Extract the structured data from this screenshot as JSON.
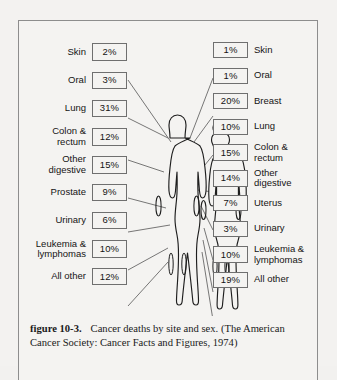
{
  "figure": {
    "caption_label": "figure 10-3.",
    "caption_text": "Cancer deaths by site and sex. (The American Cancer Society: Cancer Facts and Figures, 1974)"
  },
  "chart_data": {
    "type": "bar",
    "title": "Cancer deaths by site and sex",
    "source": "The American Cancer Society: Cancer Facts and Figures, 1974",
    "unit": "percent of cancer deaths",
    "xlabel": "",
    "ylabel": "",
    "series": [
      {
        "name": "Male",
        "side": "left",
        "categories": [
          "Skin",
          "Oral",
          "Lung",
          "Colon &\nrectum",
          "Other\ndigestive",
          "Prostate",
          "Urinary",
          "Leukemia &\nlymphomas",
          "All other"
        ],
        "values": [
          2,
          3,
          31,
          12,
          15,
          9,
          6,
          10,
          12
        ],
        "labels": [
          "2%",
          "3%",
          "31%",
          "12%",
          "15%",
          "9%",
          "6%",
          "10%",
          "12%"
        ]
      },
      {
        "name": "Female",
        "side": "right",
        "categories": [
          "Skin",
          "Oral",
          "Breast",
          "Lung",
          "Colon &\nrectum",
          "Other\ndigestive",
          "Uterus",
          "Urinary",
          "Leukemia &\nlymphomas",
          "All other"
        ],
        "values": [
          1,
          1,
          20,
          10,
          15,
          14,
          7,
          3,
          10,
          19
        ],
        "labels": [
          "1%",
          "1%",
          "20%",
          "10%",
          "15%",
          "14%",
          "7%",
          "3%",
          "10%",
          "19%"
        ]
      }
    ]
  },
  "colors": {
    "page_background": "#f3f2f0",
    "frame_border": "#8d8d8d",
    "box_border": "#6f6f6f",
    "ink": "#141414",
    "leader_line": "#555555"
  }
}
